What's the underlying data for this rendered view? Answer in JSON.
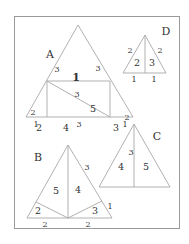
{
  "figures": {
    "A": {
      "name": "A",
      "top_triangle_area": "1",
      "left_side_upper": "3",
      "right_side_upper": "3",
      "rect_top": "3",
      "rect_area_upper": "5",
      "rect_area_lower": "4",
      "left_side_lower": "2",
      "left_corner_area": "2",
      "right_side_lower": "2",
      "right_corner_area": "3",
      "base_left": "1",
      "base_mid": "3",
      "base_right": "1"
    },
    "B": {
      "name": "B",
      "right_side": "3",
      "area_left": "5",
      "area_right": "4",
      "left_corner_area": "2",
      "right_corner_area": "3",
      "right_corner_side": "1",
      "base_left": "2",
      "base_right": "2"
    },
    "C": {
      "name": "C",
      "apex_label": "1",
      "height": "3",
      "area_left": "4",
      "area_right": "5"
    },
    "D": {
      "name": "D",
      "left_side": "2",
      "right_side": "2",
      "area_left": "2",
      "area_right": "3",
      "base_left": "1",
      "base_right": "1"
    }
  },
  "colors": {
    "line": "#a8a8a8",
    "text": "#333333",
    "frame": "#9a9a9a"
  }
}
